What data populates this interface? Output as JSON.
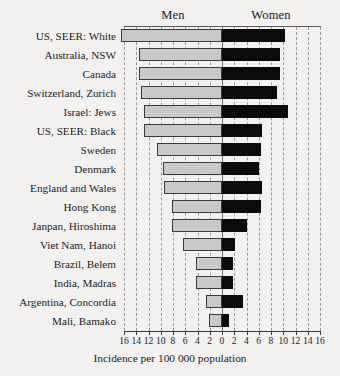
{
  "chart_data": {
    "type": "bar",
    "orientation": "horizontal-diverging",
    "title": "",
    "xlabel": "Incidence per 100 000 population",
    "ylabel": "",
    "grid": true,
    "legend_position": "top",
    "left_group": "Men",
    "right_group": "Women",
    "xlim": [
      -16,
      16
    ],
    "xticks": [
      -16,
      -14,
      -12,
      -10,
      -8,
      -6,
      -4,
      -2,
      0,
      2,
      4,
      6,
      8,
      10,
      12,
      14,
      16
    ],
    "xticklabels": [
      "16",
      "14",
      "12",
      "10",
      "8",
      "6",
      "4",
      "2",
      "0",
      "2",
      "4",
      "6",
      "8",
      "10",
      "12",
      "14",
      "16"
    ],
    "categories": [
      "US, SEER:  White",
      "Australia, NSW",
      "Canada",
      "Switzerland, Zurich",
      "Israel: Jews",
      "US, SEER: Black",
      "Sweden",
      "Denmark",
      "England and Wales",
      "Hong Kong",
      "Janpan, Hiroshima",
      "Viet Nam, Hanoi",
      "Brazil, Belem",
      "India, Madras",
      "Argentina, Concordia",
      "Mali, Bamako"
    ],
    "series": [
      {
        "name": "Men",
        "color": "#c9c9c7",
        "values": [
          16.5,
          13.6,
          13.6,
          13.3,
          12.8,
          12.7,
          10.6,
          9.6,
          9.4,
          8.2,
          8.2,
          6.3,
          4.2,
          4.2,
          2.6,
          2.1
        ]
      },
      {
        "name": "Women",
        "color": "#0b0b0b",
        "values": [
          10.3,
          9.5,
          9.5,
          9.0,
          10.8,
          6.5,
          6.4,
          6.1,
          6.5,
          6.4,
          4.1,
          2.1,
          1.8,
          1.8,
          3.4,
          1.2
        ]
      }
    ]
  },
  "axis": {
    "title": "Incidence per 100 000 population"
  }
}
